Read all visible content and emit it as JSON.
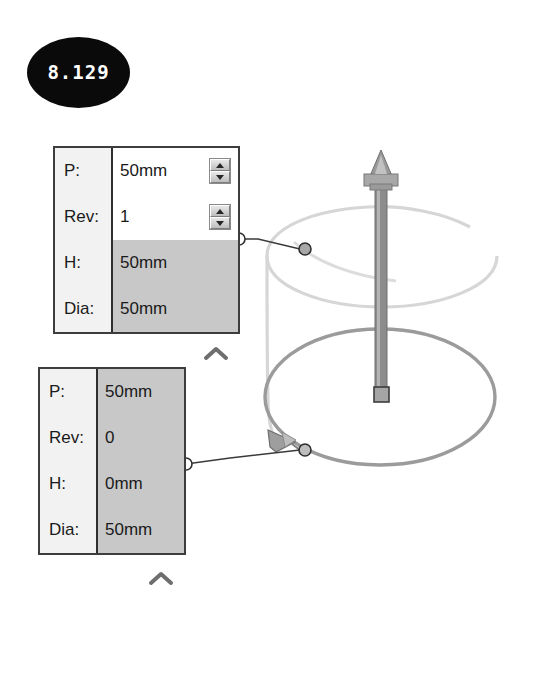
{
  "badge": {
    "name": "dimension-value-badge",
    "value": "8.129"
  },
  "panels": [
    {
      "id": "helix-panel-upper",
      "rows": [
        {
          "label": "P:",
          "value": "50mm",
          "shaded": false,
          "spinner": true
        },
        {
          "label": "Rev:",
          "value": "1",
          "shaded": false,
          "spinner": true
        },
        {
          "label": "H:",
          "value": "50mm",
          "shaded": true,
          "spinner": false
        },
        {
          "label": "Dia:",
          "value": "50mm",
          "shaded": true,
          "spinner": false
        }
      ],
      "collapse_icon": "chevron-up-icon"
    },
    {
      "id": "helix-panel-lower",
      "rows": [
        {
          "label": "P:",
          "value": "50mm",
          "shaded": true,
          "spinner": false
        },
        {
          "label": "Rev:",
          "value": "0",
          "shaded": true,
          "spinner": false
        },
        {
          "label": "H:",
          "value": "0mm",
          "shaded": true,
          "spinner": false
        },
        {
          "label": "Dia:",
          "value": "50mm",
          "shaded": true,
          "spinner": false
        }
      ],
      "collapse_icon": "chevron-up-icon"
    }
  ],
  "viewport": {
    "name": "helix-3d-viewport",
    "elements": [
      "axis-shaft",
      "axis-arrow-head",
      "axis-base-square-handle",
      "helix-curve",
      "base-circle",
      "direction-arrow-glyph",
      "leader-line-upper",
      "leader-line-lower",
      "leader-endpoint-upper",
      "leader-endpoint-lower"
    ]
  },
  "colors": {
    "badge_fill": "#0a0a0a",
    "badge_text": "#ffffff",
    "panel_border": "#3d3d3d",
    "label_bg": "#f2f2f2",
    "value_bg": "#ffffff",
    "value_shaded_bg": "#c8c8c8",
    "helix_stroke": "#d0d0d0",
    "base_circle_stroke": "#9b9b9b",
    "shaft_fill": "#8c8c8c",
    "leader_stroke": "#3a3a3a"
  }
}
